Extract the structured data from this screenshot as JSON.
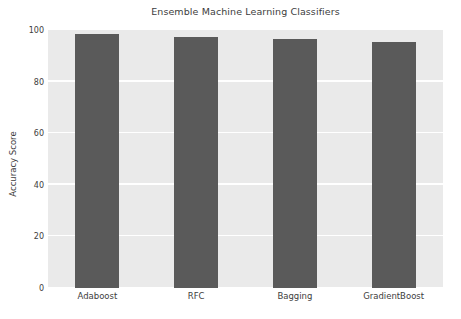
{
  "chart_data": {
    "type": "bar",
    "title": "Ensemble Machine Learning Classifiers",
    "xlabel": "",
    "ylabel": "Accuracy Score",
    "categories": [
      "Adaboost",
      "RFC",
      "Bagging",
      "GradientBoost"
    ],
    "values": [
      98.4,
      97.3,
      96.5,
      95.3
    ],
    "ylim": [
      0,
      100
    ],
    "yticks": [
      0,
      20,
      40,
      60,
      80,
      100
    ],
    "ytick_labels": [
      "0",
      "20",
      "40",
      "60",
      "80",
      "100"
    ],
    "grid": true,
    "grid_axis": "y",
    "legend": null,
    "bar_color": "#5a5a5a",
    "plot_background": "#eaeaea",
    "figure_background": "#ffffff",
    "gridline_color": "#ffffff",
    "text_color": "#3d3d3d"
  }
}
